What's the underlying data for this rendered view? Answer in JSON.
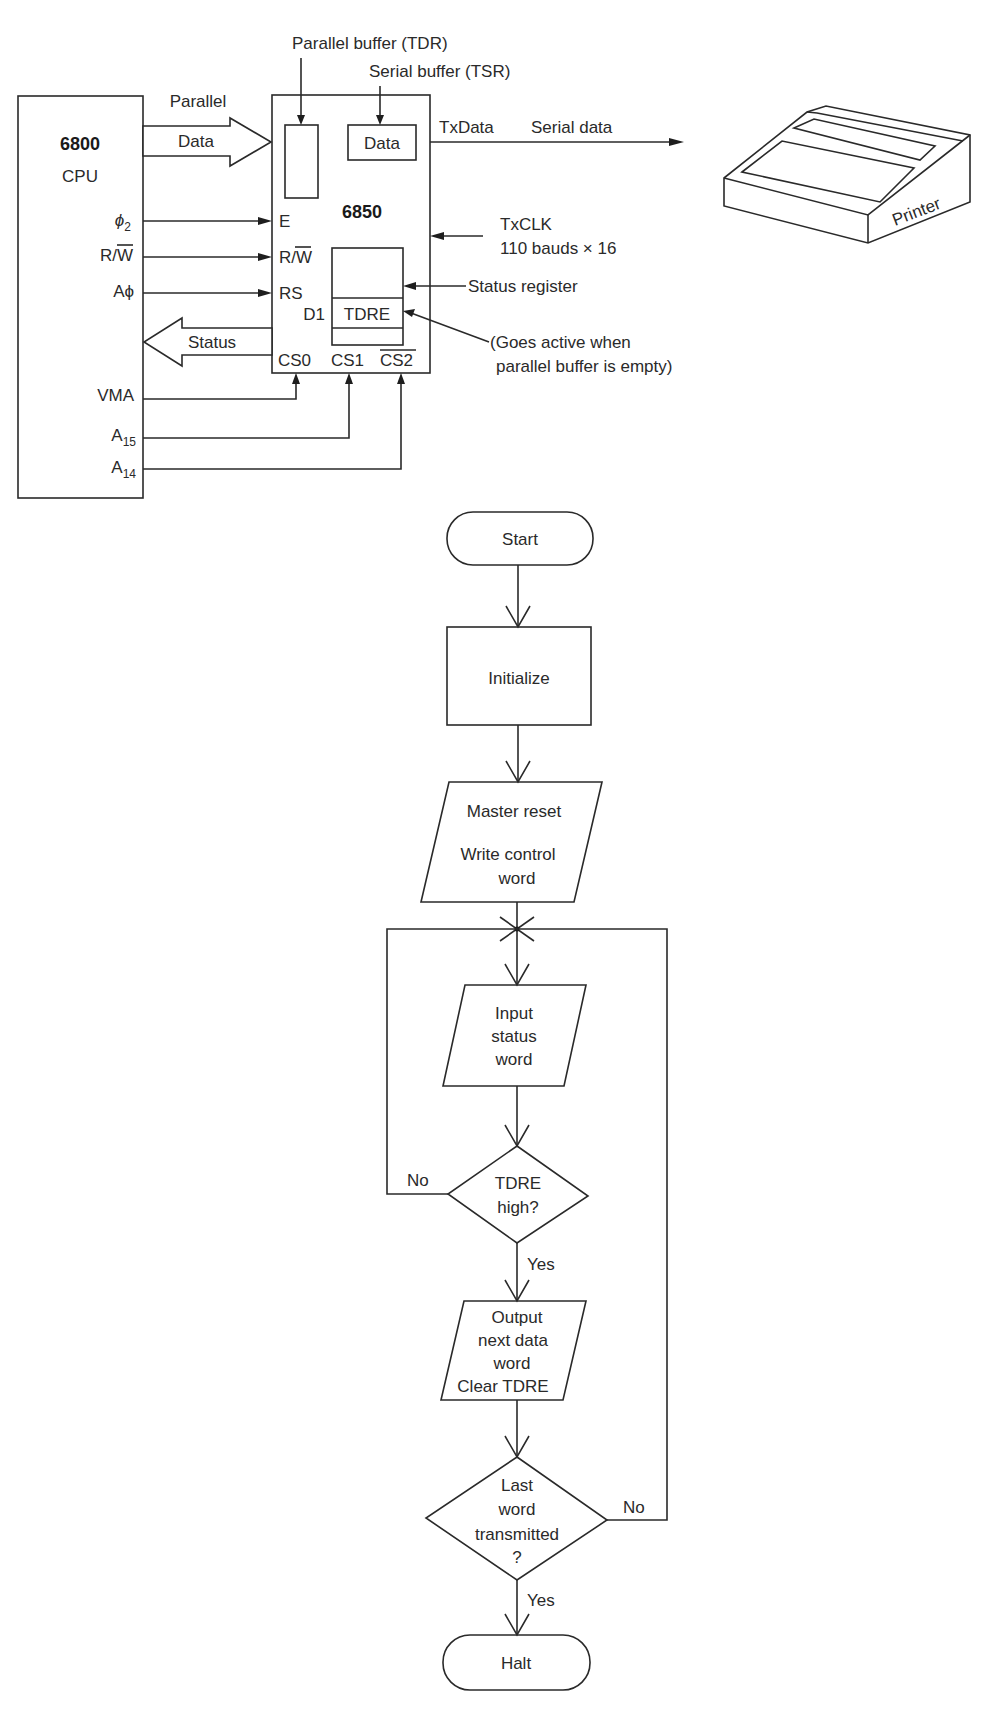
{
  "block_diagram": {
    "cpu": {
      "name": "6800",
      "label": "CPU"
    },
    "acia": {
      "name": "6850"
    },
    "parallel_buffer_label": "Parallel buffer (TDR)",
    "serial_buffer_label": "Serial buffer (TSR)",
    "serial_buffer_content": "Data",
    "parallel_data_arrow": {
      "line1": "Parallel",
      "line2": "Data"
    },
    "status_arrow": "Status",
    "txdata_label": "TxData",
    "serial_data_label": "Serial data",
    "txclk_label": "TxCLK",
    "txclk_rate": "110 bauds × 16",
    "status_register_label": "Status register",
    "tdre_note_line1": "(Goes active when",
    "tdre_note_line2": "parallel buffer is empty)",
    "tdre_label": "TDRE",
    "d1_label": "D1",
    "printer_label": "Printer",
    "cpu_signals": {
      "phi2": {
        "main": "ϕ",
        "sub": "2"
      },
      "rw": {
        "main": "R/",
        "bar": "W"
      },
      "a0": "Aϕ",
      "vma": "VMA",
      "a15": {
        "main": "A",
        "sub": "15"
      },
      "a14": {
        "main": "A",
        "sub": "14"
      }
    },
    "acia_pins": {
      "e": "E",
      "rw": {
        "main": "R/",
        "bar": "W"
      },
      "rs": "RS",
      "cs0": "CS0",
      "cs1": "CS1",
      "cs2": "CS2"
    }
  },
  "flowchart": {
    "start": "Start",
    "initialize": "Initialize",
    "master_reset": {
      "line1": "Master reset",
      "line2": "Write control",
      "line3": "word"
    },
    "input_status": {
      "line1": "Input",
      "line2": "status",
      "line3": "word"
    },
    "tdre_decision": {
      "line1": "TDRE",
      "line2": "high?"
    },
    "output_data": {
      "line1": "Output",
      "line2": "next data",
      "line3": "word",
      "line4": "Clear TDRE"
    },
    "last_word_decision": {
      "line1": "Last",
      "line2": "word",
      "line3": "transmitted",
      "line4": "?"
    },
    "halt": "Halt",
    "yes_label": "Yes",
    "no_label": "No"
  }
}
